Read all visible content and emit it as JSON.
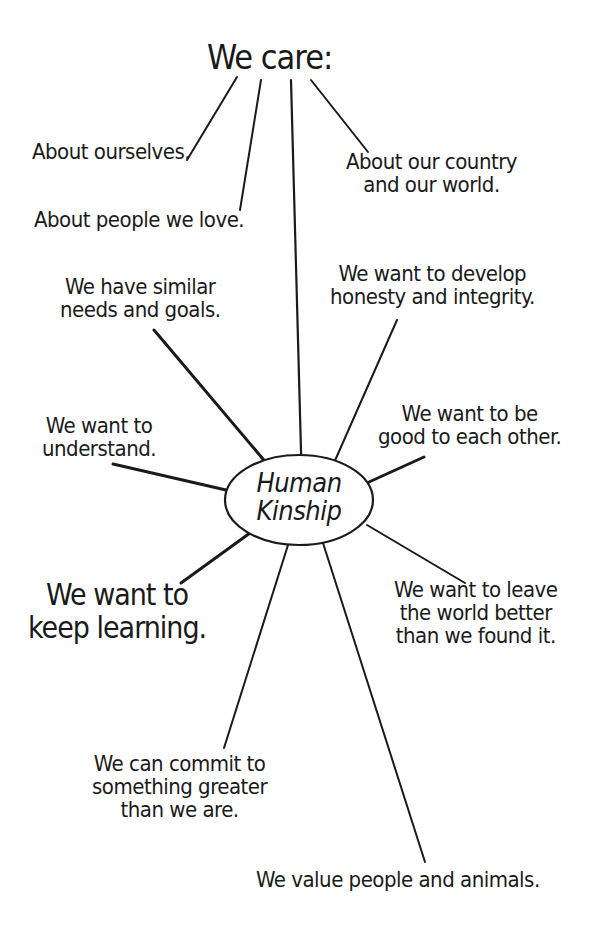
{
  "diagram": {
    "type": "mind-map",
    "title": "We care:",
    "center": "Human\nKinship",
    "care_branches": [
      "About ourselves.",
      "About people we love.",
      "About our country\nand our world."
    ],
    "kinship_branches": [
      "We have similar\nneeds and goals.",
      "We want to develop\nhonesty and integrity.",
      "We want to\nunderstand.",
      "We want to be\ngood to each other.",
      "We want to\nkeep learning.",
      "We want to leave\nthe world better\nthan we found it.",
      "We can commit to\nsomething greater\nthan we are.",
      "We value people and animals."
    ],
    "colors": {
      "ink": "#1a1a1a",
      "background": "#ffffff"
    }
  }
}
